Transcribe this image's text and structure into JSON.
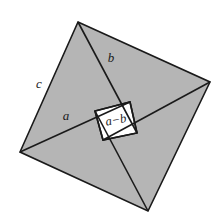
{
  "figure": {
    "title": "Pythagorean theorem dissection diagram",
    "canvas": {
      "width": 224,
      "height": 224,
      "background": "#ffffff"
    },
    "colors": {
      "triangle_fill": "#b5b5b5",
      "inner_square_fill": "#ffffff",
      "stroke": "#1a1a1a",
      "label_color": "#1a1a1a"
    },
    "stroke_width": 1.6,
    "outer_square": {
      "name": "outer-square",
      "side_label": "c",
      "vertices": [
        {
          "name": "top",
          "x": 78,
          "y": 22
        },
        {
          "name": "right",
          "x": 210,
          "y": 82
        },
        {
          "name": "bottom",
          "x": 148,
          "y": 211
        },
        {
          "name": "left",
          "x": 20,
          "y": 152
        }
      ]
    },
    "inner_square": {
      "name": "inner-square",
      "side_label": "a−b",
      "vertices": [
        {
          "name": "inner-top",
          "x": 130,
          "y": 102
        },
        {
          "name": "inner-right",
          "x": 137,
          "y": 133
        },
        {
          "name": "inner-bottom",
          "x": 103,
          "y": 140
        },
        {
          "name": "inner-left",
          "x": 95,
          "y": 111
        }
      ]
    },
    "triangles": [
      {
        "name": "triangle-upper-left",
        "points": [
          {
            "x": 78,
            "y": 22
          },
          {
            "x": 130,
            "y": 102
          },
          {
            "x": 20,
            "y": 152
          }
        ],
        "leg_short_label": "b",
        "leg_long_label": "a",
        "hypotenuse_label": "c"
      },
      {
        "name": "triangle-upper-right",
        "points": [
          {
            "x": 78,
            "y": 22
          },
          {
            "x": 210,
            "y": 82
          },
          {
            "x": 137,
            "y": 133
          }
        ],
        "leg_short_label": "b",
        "hypotenuse_label": "c"
      },
      {
        "name": "triangle-lower-right",
        "points": [
          {
            "x": 210,
            "y": 82
          },
          {
            "x": 148,
            "y": 211
          },
          {
            "x": 103,
            "y": 140
          }
        ],
        "leg_short_label": "b",
        "hypotenuse_label": "c"
      },
      {
        "name": "triangle-lower-left",
        "points": [
          {
            "x": 148,
            "y": 211
          },
          {
            "x": 20,
            "y": 152
          },
          {
            "x": 95,
            "y": 111
          }
        ],
        "leg_short_label": "b",
        "hypotenuse_label": "c"
      }
    ],
    "cevians": [
      {
        "name": "cevian-top-to-inner-right",
        "x1": 78,
        "y1": 22,
        "x2": 137,
        "y2": 133
      },
      {
        "name": "cevian-right-to-inner-bottom",
        "x1": 210,
        "y1": 82,
        "x2": 103,
        "y2": 140
      },
      {
        "name": "cevian-bottom-to-inner-left",
        "x1": 148,
        "y1": 211,
        "x2": 95,
        "y2": 111
      },
      {
        "name": "cevian-left-to-inner-top",
        "x1": 20,
        "y1": 152,
        "x2": 130,
        "y2": 102
      }
    ],
    "labels": [
      {
        "name": "label-c",
        "text": "c",
        "x": 39,
        "y": 85,
        "rotate": 0,
        "size": 13
      },
      {
        "name": "label-b",
        "text": "b",
        "x": 111,
        "y": 59,
        "rotate": 0,
        "size": 13
      },
      {
        "name": "label-a",
        "text": "a",
        "x": 66,
        "y": 117,
        "rotate": 0,
        "size": 13
      },
      {
        "name": "label-a-minus-b",
        "text": "a−b",
        "x": 116,
        "y": 121,
        "rotate": -11,
        "size": 12.5
      }
    ]
  }
}
